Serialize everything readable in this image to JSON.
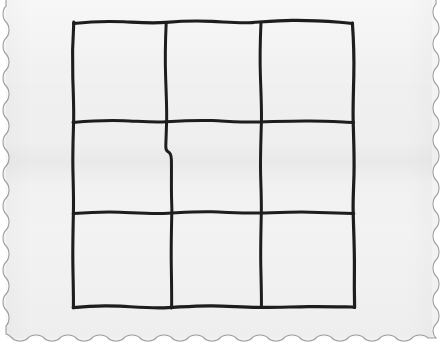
{
  "scene": {
    "title": "Hand-drawn tic-tac-toe grid on scalloped-edge paper",
    "medium": "black ink on paper",
    "paper_color": "#f4f4f4",
    "paper_edge_color": "#9a9a9a",
    "background_color": "#ffffff",
    "ink_color": "#1a1a1a",
    "edge_style": "scalloped",
    "edges_with_scallop": [
      "left",
      "right",
      "bottom"
    ],
    "scallop_period_px": 16,
    "scallop_amplitude_px": 4
  },
  "paper": {
    "name": "paper-sheet",
    "x": 2,
    "y": 0,
    "width": 436,
    "height": 340
  },
  "grid": {
    "name": "tic-tac-toe-grid",
    "rows": 3,
    "columns": 3,
    "bounds": {
      "left": 73,
      "top": 22,
      "right": 354,
      "bottom": 307
    },
    "vertical_lines_x": [
      166,
      261
    ],
    "horizontal_lines_y": [
      122,
      213
    ],
    "stroke_width": 3,
    "hand_drawn": true,
    "cells": [
      {
        "id": "cell-r1c1",
        "row": 1,
        "column": 1,
        "mark": ""
      },
      {
        "id": "cell-r1c2",
        "row": 1,
        "column": 2,
        "mark": ""
      },
      {
        "id": "cell-r1c3",
        "row": 1,
        "column": 3,
        "mark": ""
      },
      {
        "id": "cell-r2c1",
        "row": 2,
        "column": 1,
        "mark": ""
      },
      {
        "id": "cell-r2c2",
        "row": 2,
        "column": 2,
        "mark": ""
      },
      {
        "id": "cell-r2c3",
        "row": 2,
        "column": 3,
        "mark": ""
      },
      {
        "id": "cell-r3c1",
        "row": 3,
        "column": 1,
        "mark": ""
      },
      {
        "id": "cell-r3c2",
        "row": 3,
        "column": 2,
        "mark": ""
      },
      {
        "id": "cell-r3c3",
        "row": 3,
        "column": 3,
        "mark": ""
      }
    ]
  }
}
